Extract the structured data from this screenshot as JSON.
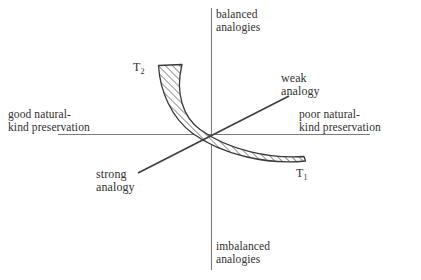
{
  "figure": {
    "type": "quadrant-diagram",
    "background_color": "#ffffff",
    "line_color": "#4a4a4a",
    "axis_color": "#6e6e6e",
    "hatch_color": "#3a3a3a",
    "text_color": "#2f2f2f",
    "axes": {
      "vertical": {
        "top_label": "balanced\nanalogies",
        "top_label_line1": "balanced",
        "top_label_line2": "analogies",
        "bottom_label_line1": "imbalanced",
        "bottom_label_line2": "analogies"
      },
      "horizontal": {
        "left_label_line1": "good natural-",
        "left_label_line2": "kind preservation",
        "right_label_line1": "poor natural-",
        "right_label_line2": "kind preservation"
      }
    },
    "diagonal_line": {
      "upper_right_label_line1": "weak",
      "upper_right_label_line2": "analogy",
      "lower_left_label_line1": "strong",
      "lower_left_label_line2": "analogy"
    },
    "band": {
      "description": "hatched crescent band",
      "end_upper_left_label": "T",
      "end_upper_left_subscript": "2",
      "end_lower_right_label": "T",
      "end_lower_right_subscript": "1"
    }
  }
}
